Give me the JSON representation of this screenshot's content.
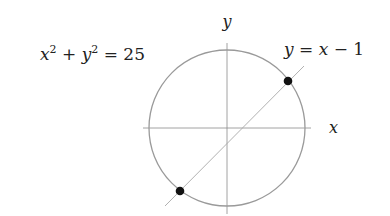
{
  "diagram": {
    "axis_labels": {
      "x": "x",
      "y": "y"
    },
    "circle": {
      "equation_lhs_x": "x",
      "sup1": "2",
      "plus": " + ",
      "equation_lhs_y": "y",
      "sup2": "2",
      "equals": " = ",
      "rhs": "25"
    },
    "line": {
      "y": "y",
      "equals": " = ",
      "x": "x",
      "minus": " − ",
      "c": "1"
    },
    "intersection_points": [
      {
        "x": 4,
        "y": 3
      },
      {
        "x": -3,
        "y": -4
      }
    ],
    "colors": {
      "circle": "#9a9a9a",
      "axes": "#8a8a8a",
      "line": "#a8a8a8",
      "points": "#111111",
      "text": "#222222"
    }
  }
}
